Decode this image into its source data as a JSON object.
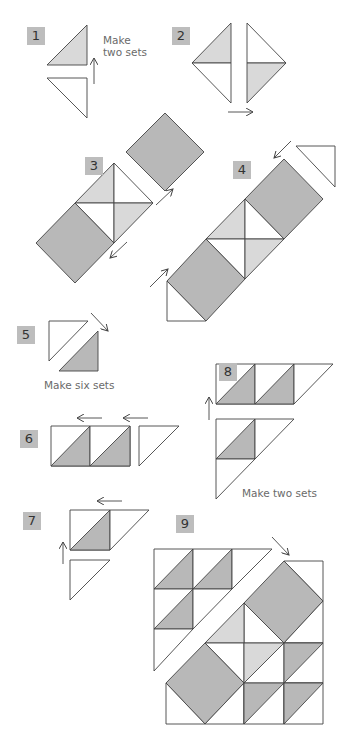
{
  "diagram": {
    "type": "quilt-block-assembly-instructions",
    "colors": {
      "dark_fabric": "#b8b8b8",
      "light_fabric": "#d9d9d9",
      "background_fabric": "#ffffff",
      "outline": "#444444",
      "label_box": "#bdbdbd"
    },
    "steps": [
      {
        "id": "step1",
        "number": "1",
        "note": "Make two sets",
        "note_line1": "Make",
        "note_line2": "two sets"
      },
      {
        "id": "step2",
        "number": "2"
      },
      {
        "id": "step3",
        "number": "3"
      },
      {
        "id": "step4",
        "number": "4"
      },
      {
        "id": "step5",
        "number": "5",
        "note": "Make six sets"
      },
      {
        "id": "step6",
        "number": "6"
      },
      {
        "id": "step7",
        "number": "7"
      },
      {
        "id": "step8",
        "number": "8",
        "note": "Make two sets"
      },
      {
        "id": "step9",
        "number": "9"
      }
    ]
  }
}
